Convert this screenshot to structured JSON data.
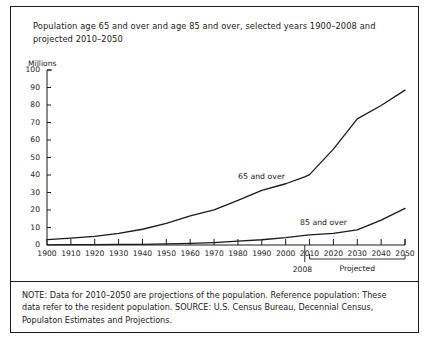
{
  "title": "Population age 65 and over and age 85 and over, selected years 1900–2008 and projected 2010–2050",
  "note": "NOTE: Data for 2010–2050 are projections of the population. Reference population: These data refer to the resident population. SOURCE: U.S. Census Bureau, Decennial Census, Populaton Estimates and Projections.",
  "annotations": {
    "marker_year": "2008",
    "projected_label": "Projected"
  },
  "chart_data": {
    "type": "line",
    "title": "Population age 65 and over and age 85 and over, selected years 1900–2008 and projected 2010–2050",
    "xlabel": "",
    "ylabel": "Millions",
    "ylim": [
      0,
      100
    ],
    "xlim": [
      1900,
      2050
    ],
    "yticks": [
      0,
      10,
      20,
      30,
      40,
      50,
      60,
      70,
      80,
      90,
      100
    ],
    "xticks": [
      1900,
      1910,
      1920,
      1930,
      1940,
      1950,
      1960,
      1970,
      1980,
      1990,
      2000,
      2010,
      2020,
      2030,
      2040,
      2050
    ],
    "grid": false,
    "legend": "inline-labels",
    "x": [
      1900,
      1910,
      1920,
      1930,
      1940,
      1950,
      1960,
      1970,
      1980,
      1990,
      2000,
      2008,
      2010,
      2020,
      2030,
      2040,
      2050
    ],
    "series": [
      {
        "name": "65 and over",
        "values": [
          3.1,
          3.9,
          4.9,
          6.6,
          9.0,
          12.3,
          16.6,
          20.1,
          25.5,
          31.2,
          35.0,
          38.9,
          40.2,
          54.8,
          72.1,
          79.7,
          88.5
        ]
      },
      {
        "name": "85 and over",
        "values": [
          0.1,
          0.2,
          0.2,
          0.3,
          0.4,
          0.6,
          0.9,
          1.4,
          2.2,
          3.0,
          4.2,
          5.5,
          5.8,
          6.6,
          8.7,
          14.2,
          20.9
        ]
      }
    ]
  }
}
